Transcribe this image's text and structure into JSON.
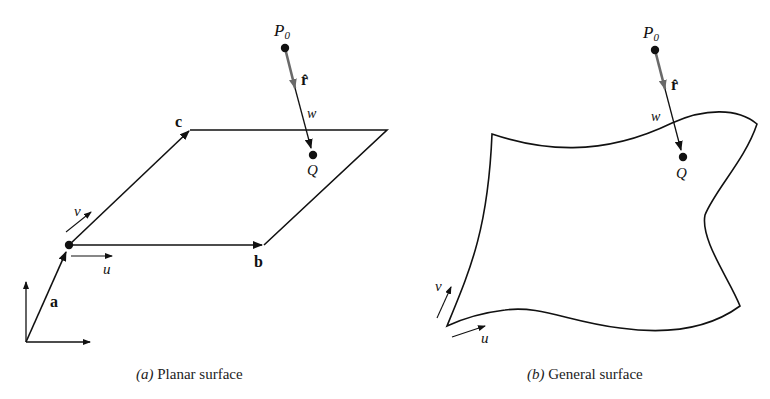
{
  "colors": {
    "ink": "#111111",
    "unit_vector": "#6a6a6a",
    "background": "#ffffff"
  },
  "panels": [
    {
      "id": "a",
      "caption_letter": "(a)",
      "caption_text": " Planar surface",
      "labels": {
        "point_start": "P",
        "point_start_sub": "0",
        "unit_vector": "r̂",
        "distance": "w",
        "foot_point": "Q",
        "vec_a": "a",
        "vec_b": "b",
        "vec_c": "c",
        "param_u": "u",
        "param_v": "v"
      }
    },
    {
      "id": "b",
      "caption_letter": "(b)",
      "caption_text": " General surface",
      "labels": {
        "point_start": "P",
        "point_start_sub": "0",
        "unit_vector": "r̂",
        "distance": "w",
        "foot_point": "Q",
        "param_u": "u",
        "param_v": "v"
      }
    }
  ]
}
